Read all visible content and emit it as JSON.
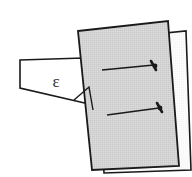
{
  "figure": {
    "type": "technical-illustration",
    "canvas": {
      "width": 192,
      "height": 177,
      "background": "#ffffff"
    },
    "labels": {
      "angle_symbol": "ε"
    },
    "colors": {
      "outline": "#1a1a1a",
      "panel_fill_gray": "#d2d2d2",
      "panel_fill_white": "#fbfbfb",
      "background": "#ffffff",
      "fastener": "#1a1a1a",
      "label_text": "#2b2b2b"
    },
    "shapes": {
      "back_panel": {
        "name": "back-panel-white",
        "fill": "#fbfbfb",
        "points": "96,40 186,31 191,170 104,173"
      },
      "front_panel": {
        "name": "front-panel-gray",
        "fill": "#d2d2d2",
        "points": "78,31 168,21 179,166 92,170"
      },
      "wedge": {
        "name": "wedge-block",
        "fill": "#ffffff",
        "points": "20,60 83,58 89,104 20,88"
      },
      "angle_marker": {
        "name": "angle-marker-triangle",
        "points": "74,100 89,87 94,112"
      }
    },
    "fasteners": [
      {
        "name": "fastener-upper",
        "shaft": {
          "x1": 102,
          "y1": 70,
          "x2": 155,
          "y2": 65
        },
        "head": {
          "x1": 152,
          "y1": 61,
          "x2": 157,
          "y2": 70
        },
        "tip": {
          "cx": 156,
          "cy": 66,
          "r": 2.3
        }
      },
      {
        "name": "fastener-lower",
        "shaft": {
          "x1": 107,
          "y1": 115,
          "x2": 161,
          "y2": 108
        },
        "head": {
          "x1": 157,
          "y1": 104,
          "x2": 163,
          "y2": 113
        },
        "tip": {
          "cx": 161,
          "cy": 108,
          "r": 2.3
        }
      }
    ],
    "annotation": {
      "epsilon": {
        "x": 56,
        "y": 87
      }
    }
  }
}
